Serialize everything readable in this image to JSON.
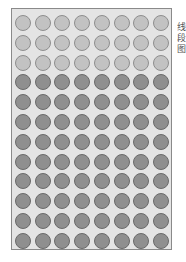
{
  "diagram": {
    "type": "dot-grid",
    "columns": 8,
    "rows": 12,
    "light_rows": 3,
    "dark_rows": 9,
    "colors": {
      "background": "#e4e4e4",
      "border": "#8a8a8a",
      "light_fill": "#c2c2c2",
      "dark_fill": "#8f8f8f"
    }
  },
  "side_text": "线段图"
}
